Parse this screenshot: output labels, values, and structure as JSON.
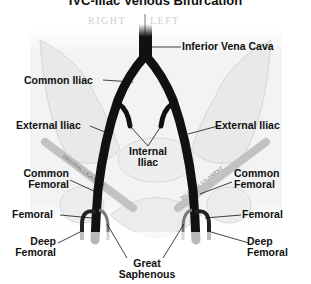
{
  "title": "IVC-Iliac Venous Bifurcation",
  "orientation": {
    "right": "RIGHT",
    "left": "LEFT"
  },
  "ligament_text": "INGUINAL LIGAMENT",
  "labels": {
    "inferior_vena_cava": "Inferior Vena Cava",
    "common_iliac": "Common Iliac",
    "external_iliac_right": "External Iliac",
    "external_iliac_left": "External Iliac",
    "internal_iliac_line1": "Internal",
    "internal_iliac_line2": "Iliac",
    "common_femoral_right_line1": "Common",
    "common_femoral_right_line2": "Femoral",
    "common_femoral_left_line1": "Common",
    "common_femoral_left_line2": "Femoral",
    "femoral_right": "Femoral",
    "femoral_left": "Femoral",
    "deep_femoral_right_line1": "Deep",
    "deep_femoral_right_line2": "Femoral",
    "deep_femoral_left_line1": "Deep",
    "deep_femoral_left_line2": "Femoral",
    "great_saphenous_line1": "Great",
    "great_saphenous_line2": "Saphenous"
  },
  "colors": {
    "vein": "#111111",
    "bone": "#f2f2f2",
    "bone_outline": "#d8d8d8",
    "ligament": "#bdbdbd",
    "text": "#111111"
  }
}
